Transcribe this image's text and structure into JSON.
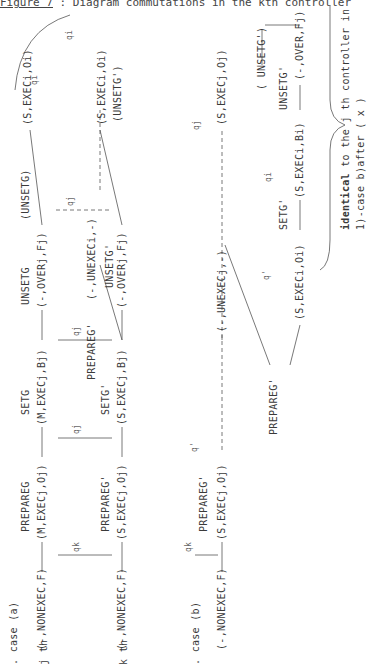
{
  "title": {
    "figure_label": "Figure 7",
    "text": " : Diagram commutations in the kth controller"
  },
  "case_a": {
    "label": ". case (a)",
    "row_j": "j th",
    "row_k": "k th",
    "j_states": [
      "(-,NONEXEC,F)",
      "(M,EXECj,Oj)",
      "(M,EXECj,Bj)",
      "(-,OVERj,Fj)",
      "(S,EXECi,Oi)"
    ],
    "j_transitions": [
      "PREPAREG",
      "SETG",
      "UNSETG",
      "(UNSETG)"
    ],
    "k_states": [
      "(-,NONEXEC,F)",
      "(S,EXECj,Oj)",
      "(S,EXECj,Bj)",
      "(-,UNEXECi,-)",
      "(-,OVERj,Fj)",
      "(S,EXECi,Oi)"
    ],
    "k_transitions": [
      "PREPAREG'",
      "SETG'",
      "PREPAREG'",
      "UNSETG'",
      "(UNSETG')"
    ],
    "q_labels": [
      "qk",
      "qj",
      "qj",
      "qj",
      "qi",
      "qi"
    ]
  },
  "case_b": {
    "label": ". case (b)",
    "states": [
      "(-,NONEXEC,F)",
      "(S,EXECj,Oj)",
      "(-,UNEXECj,-)",
      "(S,EXECj,Oj)",
      "(S,EXECi,Oi)",
      "(S,EXECi,Bi)",
      "(-,OVER,Fj)"
    ],
    "transitions": [
      "PREPAREG'",
      "PREPAREG'",
      "SETG'",
      "UNSETG'",
      "( UNSETG')"
    ],
    "q_labels": [
      "qk",
      "q'",
      "q'",
      "qi",
      "qj"
    ],
    "note_bold": "identical",
    "note_text": " to the j th controller in",
    "note_line2": "1)-case b)after ( x )"
  }
}
